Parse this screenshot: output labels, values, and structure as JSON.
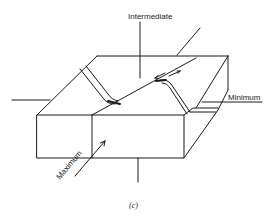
{
  "figure": {
    "caption": "(c)",
    "labels": {
      "intermediate": "Intermediate",
      "minimum": "Minimum",
      "maximum": "Maximum"
    },
    "colors": {
      "ink": "#1a1a1a",
      "background": "#ffffff"
    }
  }
}
